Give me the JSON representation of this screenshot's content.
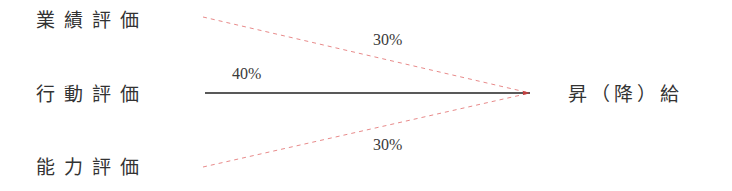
{
  "diagram": {
    "inputs": [
      {
        "label": "業績評価",
        "weight": "30%"
      },
      {
        "label": "行動評価",
        "weight": "40%"
      },
      {
        "label": "能力評価",
        "weight": "30%"
      }
    ],
    "output": {
      "label": "昇（降）給"
    },
    "colors": {
      "dashed_line": "#e88a8a",
      "solid_line": "#222222",
      "text": "#333333"
    }
  }
}
